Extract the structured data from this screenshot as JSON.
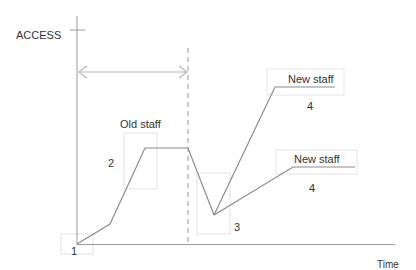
{
  "diagram": {
    "y_axis_label": "ACCESS",
    "x_axis_label": "Time",
    "labels": {
      "old_staff": "Old staff",
      "new_staff_upper": "New staff",
      "new_staff_lower": "New staff"
    },
    "markers": {
      "m1": "1",
      "m2": "2",
      "m3": "3",
      "m4_upper": "4",
      "m4_lower": "4"
    },
    "colors": {
      "axis": "#9a9a9a",
      "line": "#8c8c8c",
      "box": "#e2e2e2",
      "arrow": "#b8b8b8",
      "text": "#333333"
    }
  }
}
